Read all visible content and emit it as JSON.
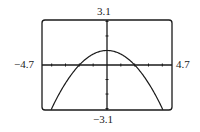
{
  "chart_data": {
    "type": "line",
    "title": "",
    "xlabel": "",
    "ylabel": "",
    "xlim": [
      -4.7,
      4.7
    ],
    "ylim": [
      -3.1,
      3.1
    ],
    "window_labels": {
      "ymax": "3.1",
      "ymin": "−3.1",
      "xmin": "−4.7",
      "xmax": "4.7"
    },
    "grid": false,
    "x_tick_step": 1,
    "y_tick_step": 1,
    "series": [
      {
        "name": "parabola",
        "description": "downward-opening parabola, vertex ≈ (0, 1), x-intercepts ≈ ±2",
        "x": [
          -4.2,
          -3,
          -2,
          -1,
          0,
          1,
          2,
          3,
          4.2
        ],
        "values": [
          -3.41,
          -1.25,
          0,
          0.75,
          1,
          0.75,
          0,
          -1.25,
          -3.41
        ]
      }
    ]
  },
  "colors": {
    "stroke": "#1a1a1a",
    "background": "#ffffff"
  }
}
